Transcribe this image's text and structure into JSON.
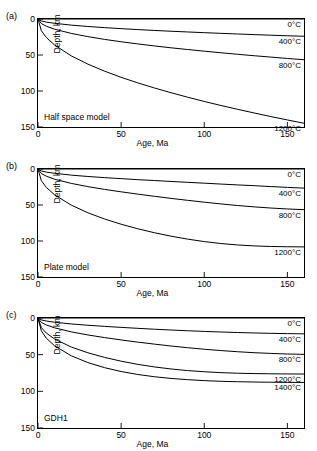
{
  "figure": {
    "background": "#ffffff",
    "line_color": "#000000"
  },
  "axes": {
    "xlabel": "Age, Ma",
    "ylabel": "Depth, km",
    "xticks": [
      0,
      50,
      100,
      150
    ],
    "yticks": [
      0,
      50,
      100,
      150
    ],
    "xlim": [
      0,
      160
    ],
    "ylim": [
      150,
      0
    ],
    "grid": false,
    "tick_direction": "in"
  },
  "panels": [
    {
      "letter": "(a)",
      "model_label": "Half space model",
      "curve_labels": [
        "0°C",
        "400°C",
        "800°C",
        "1200°C"
      ]
    },
    {
      "letter": "(b)",
      "model_label": "Plate model",
      "curve_labels": [
        "0°C",
        "400°C",
        "800°C",
        "1200°C"
      ]
    },
    {
      "letter": "(c)",
      "model_label": "GDH1",
      "curve_labels": [
        "0°C",
        "400°C",
        "800°C",
        "1200°C",
        "1400°C"
      ]
    }
  ],
  "chart_data": [
    {
      "type": "line",
      "title": "Half space model",
      "panel": "(a)",
      "xlabel": "Age, Ma",
      "ylabel": "Depth, km",
      "xlim": [
        0,
        160
      ],
      "ylim": [
        150,
        0
      ],
      "xticks": [
        0,
        50,
        100,
        150
      ],
      "yticks": [
        0,
        50,
        100,
        150
      ],
      "grid": false,
      "x": [
        0,
        2,
        5,
        10,
        20,
        30,
        40,
        50,
        60,
        70,
        80,
        90,
        100,
        110,
        120,
        130,
        140,
        150,
        160
      ],
      "series": [
        {
          "name": "0°C",
          "label": "0°C",
          "values": [
            0,
            0,
            0,
            0,
            0,
            0,
            0,
            0,
            0,
            0,
            0,
            0,
            0,
            0,
            0,
            0,
            0,
            0,
            0
          ]
        },
        {
          "name": "400°C",
          "label": "400°C",
          "values": [
            0,
            2.7,
            4.3,
            6.0,
            8.5,
            10.4,
            12.0,
            13.4,
            14.7,
            15.9,
            17.0,
            18.0,
            19.0,
            19.9,
            20.8,
            21.7,
            22.5,
            23.3,
            24.0
          ]
        },
        {
          "name": "800°C",
          "label": "800°C",
          "values": [
            0,
            6.3,
            10.0,
            14.2,
            20.0,
            24.5,
            28.3,
            31.6,
            34.6,
            37.4,
            40.0,
            42.4,
            44.7,
            46.9,
            49.0,
            51.0,
            52.9,
            54.8,
            56.6
          ]
        },
        {
          "name": "1200°C",
          "label": "1200°C",
          "values": [
            0,
            16.2,
            25.6,
            36.2,
            51.2,
            62.7,
            72.4,
            81.0,
            88.7,
            95.8,
            102.4,
            108.6,
            114.5,
            120.1,
            125.4,
            130.5,
            135.5,
            140.2,
            144.8
          ]
        }
      ]
    },
    {
      "type": "line",
      "title": "Plate model",
      "panel": "(b)",
      "xlabel": "Age, Ma",
      "ylabel": "Depth, km",
      "xlim": [
        0,
        160
      ],
      "ylim": [
        150,
        0
      ],
      "xticks": [
        0,
        50,
        100,
        150
      ],
      "yticks": [
        0,
        50,
        100,
        150
      ],
      "grid": false,
      "x": [
        0,
        2,
        5,
        10,
        20,
        30,
        40,
        50,
        60,
        70,
        80,
        90,
        100,
        110,
        120,
        130,
        140,
        150,
        160
      ],
      "series": [
        {
          "name": "0°C",
          "label": "0°C",
          "values": [
            0,
            0,
            0,
            0,
            0,
            0,
            0,
            0,
            0,
            0,
            0,
            0,
            0,
            0,
            0,
            0,
            0,
            0,
            0
          ]
        },
        {
          "name": "400°C",
          "label": "400°C",
          "values": [
            0,
            2.7,
            4.3,
            6.0,
            8.5,
            10.4,
            12.0,
            13.4,
            14.8,
            16.0,
            17.3,
            18.5,
            19.7,
            20.9,
            22.1,
            23.2,
            24.4,
            25.5,
            26.6
          ]
        },
        {
          "name": "800°C",
          "label": "800°C",
          "values": [
            0,
            6.3,
            10.0,
            14.2,
            20.0,
            24.5,
            28.3,
            31.7,
            34.9,
            37.9,
            40.8,
            43.5,
            46.1,
            48.5,
            50.7,
            52.6,
            54.2,
            55.5,
            56.5
          ]
        },
        {
          "name": "1200°C",
          "label": "1200°C",
          "values": [
            0,
            16.2,
            25.5,
            35.9,
            50.2,
            60.8,
            69.4,
            76.7,
            83.0,
            88.5,
            93.3,
            97.4,
            100.8,
            103.5,
            105.5,
            106.8,
            107.6,
            108.0,
            108.2
          ]
        }
      ]
    },
    {
      "type": "line",
      "title": "GDH1",
      "panel": "(c)",
      "xlabel": "Age, Ma",
      "ylabel": "Depth, km",
      "xlim": [
        0,
        160
      ],
      "ylim": [
        150,
        0
      ],
      "xticks": [
        0,
        50,
        100,
        150
      ],
      "yticks": [
        0,
        50,
        100,
        150
      ],
      "grid": false,
      "x": [
        0,
        2,
        5,
        10,
        20,
        30,
        40,
        50,
        60,
        70,
        80,
        90,
        100,
        110,
        120,
        130,
        140,
        150,
        160
      ],
      "series": [
        {
          "name": "0°C",
          "label": "0°C",
          "values": [
            0,
            0,
            0,
            0,
            0,
            0,
            0,
            0,
            0,
            0,
            0,
            0,
            0,
            0,
            0,
            0,
            0,
            0,
            0
          ]
        },
        {
          "name": "400°C",
          "label": "400°C",
          "values": [
            0,
            2.6,
            4.1,
            5.8,
            8.1,
            9.9,
            11.4,
            12.8,
            14.1,
            15.3,
            16.4,
            17.4,
            18.3,
            19.1,
            19.8,
            20.4,
            20.9,
            21.3,
            21.6
          ]
        },
        {
          "name": "800°C",
          "label": "800°C",
          "values": [
            0,
            6.0,
            9.5,
            13.4,
            18.9,
            23.1,
            26.7,
            29.9,
            32.9,
            35.6,
            38.2,
            40.5,
            42.6,
            44.4,
            46.0,
            47.3,
            48.3,
            49.1,
            49.6
          ]
        },
        {
          "name": "1200°C",
          "label": "1200°C",
          "values": [
            0,
            13.0,
            20.5,
            28.7,
            39.6,
            47.4,
            53.7,
            58.9,
            63.2,
            66.7,
            69.5,
            71.7,
            73.3,
            74.5,
            75.3,
            75.8,
            76.1,
            76.3,
            76.4
          ]
        },
        {
          "name": "1400°C",
          "label": "1400°C",
          "values": [
            0,
            17.5,
            27.5,
            38.0,
            51.5,
            60.8,
            67.7,
            73.0,
            77.0,
            80.1,
            82.4,
            84.1,
            85.4,
            86.3,
            86.9,
            87.3,
            87.6,
            87.8,
            87.9
          ]
        }
      ]
    }
  ]
}
